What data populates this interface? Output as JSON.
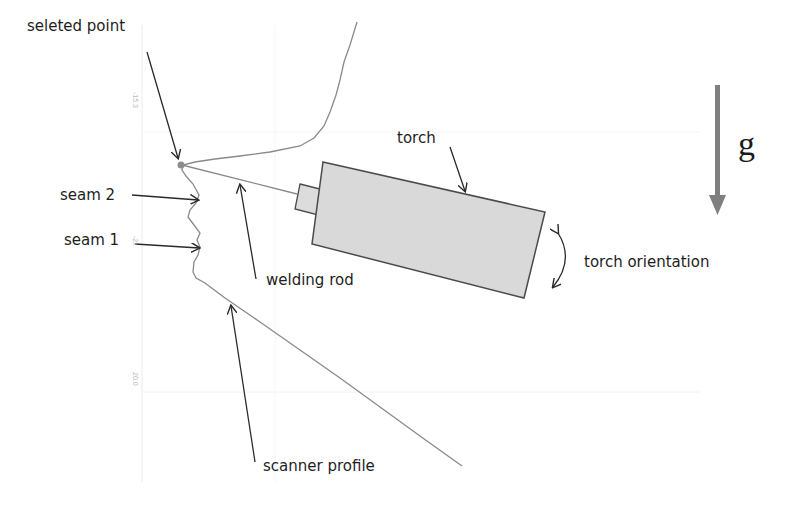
{
  "figure": {
    "labels": {
      "selected_point": "seleted point",
      "seam2": "seam 2",
      "seam1": "seam 1",
      "welding_rod": "welding rod",
      "scanner_profile": "scanner profile",
      "torch": "torch",
      "torch_orientation": "torch orientation",
      "gravity": "g"
    },
    "axis_ticks": [
      "-15.3",
      "-2x",
      "20.0"
    ],
    "colors": {
      "profile_line": "#8a8a8a",
      "arrow": "#2a2a2a",
      "torch_fill": "#d9d9d9",
      "torch_stroke": "#4a4a4a",
      "gravity_arrow": "#7f7f7f",
      "selected_point": "#8c8c8c",
      "grid": "#e8e8e8"
    }
  }
}
